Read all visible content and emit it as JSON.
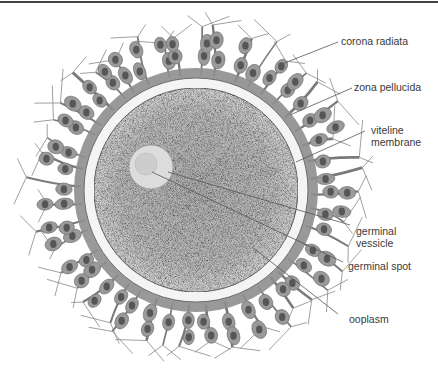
{
  "diagram": {
    "labels": [
      {
        "id": "corona-radiata",
        "text": "corona radiata",
        "x": 341,
        "y": 35,
        "line": {
          "x1": 338,
          "y1": 42,
          "x2": 282,
          "y2": 64
        }
      },
      {
        "id": "zona-pellucida",
        "text": "zona pellucida",
        "x": 354,
        "y": 81,
        "line": {
          "x1": 352,
          "y1": 88,
          "x2": 290,
          "y2": 115
        }
      },
      {
        "id": "viteline-membrane",
        "text_line1": "viteline",
        "text_line2": "membrane",
        "x": 371,
        "y": 124,
        "line": {
          "x1": 365,
          "y1": 131,
          "x2": 296,
          "y2": 162
        }
      },
      {
        "id": "germinal-vessicle",
        "text_line1": "germinal",
        "text_line2": "vessicle",
        "x": 356,
        "y": 225,
        "line": {
          "x1": 350,
          "y1": 225,
          "x2": 168,
          "y2": 172
        }
      },
      {
        "id": "germinal-spot",
        "text": "germinal spot",
        "x": 348,
        "y": 260,
        "line": {
          "x1": 343,
          "y1": 262,
          "x2": 152,
          "y2": 172
        }
      },
      {
        "id": "ooplasm",
        "text": "ooplasm",
        "x": 349,
        "y": 313,
        "line": {
          "x1": 338,
          "y1": 314,
          "x2": 252,
          "y2": 247
        }
      }
    ],
    "geometry": {
      "center": {
        "x": 196,
        "y": 190
      },
      "corona_outer_r": 168,
      "corona_inner_r": 118,
      "zona_outer_r": 112,
      "zona_inner_r": 102,
      "germinal_vesicle": {
        "cx": 151,
        "cy": 167,
        "r": 22
      },
      "germinal_spot": {
        "cx": 146,
        "cy": 164,
        "r": 11
      }
    },
    "colors": {
      "label_text": "#3a3a3a",
      "leader_line": "#555555",
      "cell_body": "#9a9a9a",
      "cell_nucleus": "#4a4a4a",
      "matrix": "#8c8c8c",
      "zona": "#f4f4f4",
      "ooplasm": "#bdbdbd",
      "vesicle": "#dedede"
    }
  }
}
